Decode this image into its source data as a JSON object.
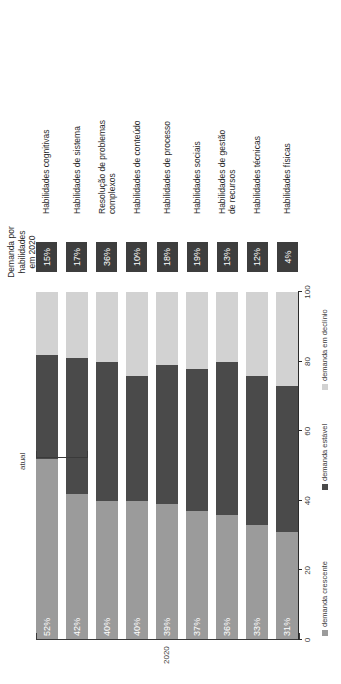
{
  "chart_data": {
    "type": "bar",
    "subtype": "horizontal-stacked-100",
    "title": "",
    "xlabel": "",
    "ylabel": "",
    "xlim": [
      0,
      100
    ],
    "grid": false,
    "legend_position": "bottom",
    "axis_ticks": [
      "0",
      "20",
      "40",
      "60",
      "80",
      "100"
    ],
    "period_labels": {
      "left": "2020",
      "right": "atual"
    },
    "badge_header": "Demanda por\nhabilidades em 2020",
    "legend": [
      {
        "label": "demanda crescente",
        "color": "#9b9b9b"
      },
      {
        "label": "demanda estável",
        "color": "#4a4a4a"
      },
      {
        "label": "demanda em declínio",
        "color": "#d2d2d2"
      }
    ],
    "categories": [
      "Habilidades cognitivas",
      "Habilidades de sistema",
      "Resolução de problemas\ncomplexos",
      "Habilidades de conteúdo",
      "Habilidades de processo",
      "Habilidades sociais",
      "Habilidades de gestão\nde recursos",
      "Habilidades técnicas",
      "Habilidades físicas"
    ],
    "series": [
      {
        "name": "demanda crescente",
        "color": "#9b9b9b",
        "values": [
          52,
          42,
          40,
          40,
          39,
          37,
          36,
          33,
          31
        ]
      },
      {
        "name": "demanda estável",
        "color": "#4a4a4a",
        "values": [
          30,
          39,
          40,
          36,
          40,
          41,
          44,
          43,
          42
        ]
      },
      {
        "name": "demanda em declínio",
        "color": "#d2d2d2",
        "values": [
          18,
          19,
          20,
          24,
          21,
          22,
          20,
          24,
          27
        ]
      }
    ],
    "bar_labels": [
      "52%",
      "42%",
      "40%",
      "40%",
      "39%",
      "37%",
      "36%",
      "33%",
      "31%"
    ],
    "badges": [
      "15%",
      "17%",
      "36%",
      "10%",
      "18%",
      "19%",
      "13%",
      "12%",
      "4%"
    ]
  }
}
